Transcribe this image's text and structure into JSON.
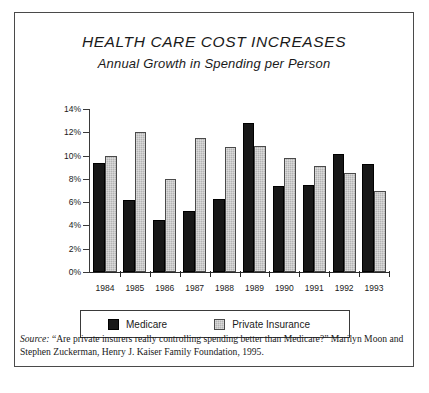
{
  "chart_data": {
    "type": "bar",
    "title": "HEALTH CARE COST INCREASES",
    "subtitle": "Annual Growth in Spending per Person",
    "xlabel": "",
    "ylabel": "",
    "categories": [
      "1984",
      "1985",
      "1986",
      "1987",
      "1988",
      "1989",
      "1990",
      "1991",
      "1992",
      "1993"
    ],
    "series": [
      {
        "name": "Medicare",
        "color": "#181818",
        "values": [
          9.4,
          6.2,
          4.5,
          5.2,
          6.3,
          12.8,
          7.4,
          7.5,
          10.1,
          9.3
        ]
      },
      {
        "name": "Private Insurance",
        "color": "#b4b4b4",
        "values": [
          10.0,
          12.0,
          8.0,
          11.5,
          10.7,
          10.8,
          9.8,
          9.1,
          8.5,
          7.0
        ]
      }
    ],
    "ylim": [
      0,
      14
    ],
    "ytick_values": [
      0,
      2,
      4,
      6,
      8,
      10,
      12,
      14
    ],
    "ytick_labels": [
      "0%",
      "2%",
      "4%",
      "6%",
      "8%",
      "10%",
      "12%",
      "14%"
    ],
    "grid": false,
    "legend_position": "bottom"
  },
  "legend": {
    "medicare_label": "Medicare",
    "private_label": "Private Insurance"
  },
  "source": {
    "label": "Source:",
    "text": " “Are private insurers really controlling spending better than Medicare?”  Marilyn Moon and Stephen Zuckerman, Henry J. Kaiser Family Foundation, 1995."
  }
}
